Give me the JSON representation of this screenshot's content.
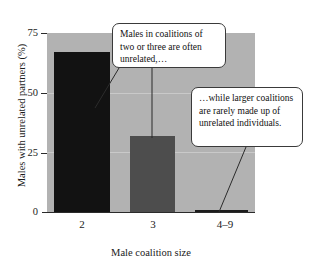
{
  "chart_data": {
    "type": "bar",
    "title": "",
    "xlabel": "Male coalition size",
    "ylabel": "Males with unrelated partners (%)",
    "categories": [
      "2",
      "3",
      "4–9"
    ],
    "values": [
      67,
      32,
      1
    ],
    "series": [
      {
        "name": "Males with unrelated partners (%)",
        "values": [
          67,
          32,
          1
        ]
      }
    ],
    "ylim": [
      0,
      75
    ],
    "yticks": [
      0,
      25,
      50,
      75
    ],
    "ytick_labels": [
      "0",
      "25",
      "50",
      "75"
    ],
    "xtick_labels": [
      "2",
      "3",
      "4–9"
    ],
    "grid": true,
    "grid_axis": "y",
    "legend": "none",
    "bar_colors": [
      "#121212",
      "#4d4d4d",
      "#1c1c1c"
    ],
    "plot_background": "#b2b2b2",
    "page_background": "#ffffff",
    "gridline_color": "#c9c9c9",
    "axis_color": "#2b2b2b",
    "annotations": [
      {
        "id": "callout-one",
        "text": "Males in coalitions of two or three are often unrelated,…",
        "points_to": [
          "2",
          "3"
        ]
      },
      {
        "id": "callout-two",
        "text": "…while larger coalitions are rarely made up of unrelated individuals.",
        "points_to": [
          "4–9"
        ]
      }
    ]
  },
  "axes": {
    "y_title": "Males with unrelated partners (%)",
    "x_title": "Male coalition size",
    "y_labels": [
      "75",
      "50",
      "25",
      "0"
    ],
    "x_labels": [
      "2",
      "3",
      "4–9"
    ]
  },
  "callouts": {
    "first": "Males in coalitions of two or three are often unrelated,…",
    "second": "…while larger coalitions are rarely made up of unrelated individuals."
  }
}
